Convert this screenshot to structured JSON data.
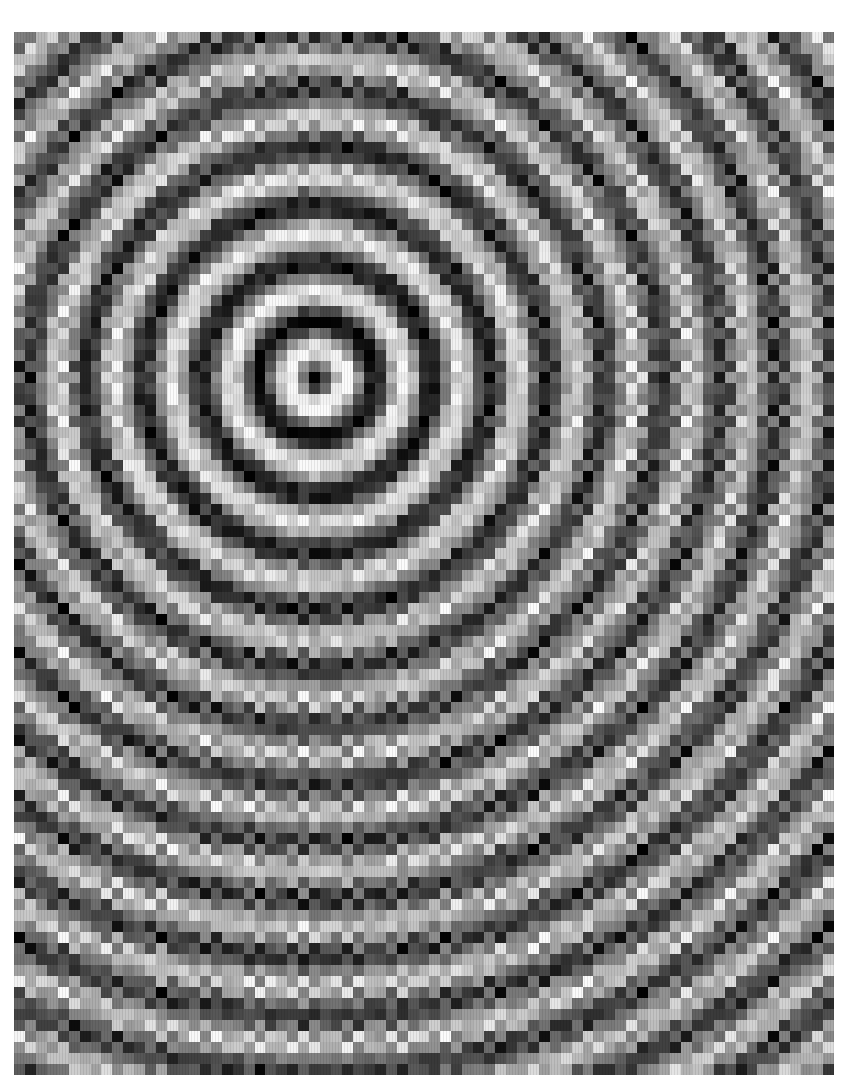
{
  "image": {
    "description": "Grayscale pixelated interference pattern of concentric rings with a dark central spot",
    "frame": {
      "left": 14,
      "top": 32,
      "width": 820,
      "height": 1043
    },
    "center": {
      "x": 299,
      "y": 342
    },
    "ring_wavelength_px": 58,
    "grid_cell_px": 11,
    "colors": {
      "dark": "#111111",
      "light": "#e6e6e6",
      "background": "#ffffff"
    }
  }
}
